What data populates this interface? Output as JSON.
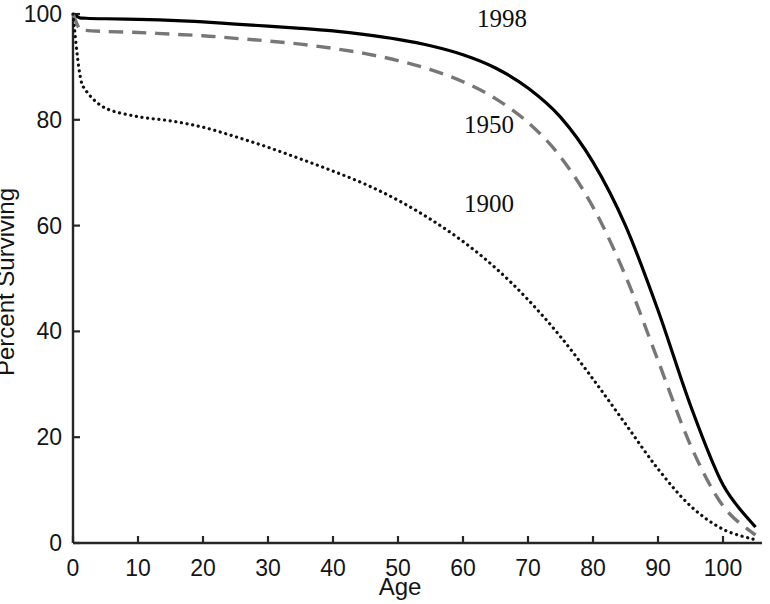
{
  "chart_data": {
    "type": "line",
    "title": "",
    "subtitle": "",
    "xlabel": "Age",
    "ylabel": "Percent Surviving",
    "xlim": [
      0,
      106
    ],
    "ylim": [
      0,
      100
    ],
    "grid": false,
    "legend_position": "inline-curve-labels",
    "x_ticks": [
      0,
      10,
      20,
      30,
      40,
      50,
      60,
      70,
      80,
      90,
      100
    ],
    "y_ticks": [
      0,
      20,
      40,
      60,
      80,
      100
    ],
    "x_tick_labels": [
      "0",
      "10",
      "20",
      "30",
      "40",
      "50",
      "60",
      "70",
      "80",
      "90",
      "100"
    ],
    "y_tick_labels": [
      "0",
      "20",
      "40",
      "60",
      "80",
      "100"
    ],
    "x": [
      0,
      1,
      2,
      5,
      10,
      15,
      20,
      25,
      30,
      35,
      40,
      45,
      50,
      55,
      60,
      65,
      70,
      75,
      80,
      85,
      90,
      95,
      100,
      105
    ],
    "series": [
      {
        "name": "1998",
        "style": "solid",
        "color": "#000000",
        "width": 3.2,
        "label_x": 66,
        "label_y": 99,
        "values": [
          100,
          99.3,
          99.2,
          99.1,
          99.0,
          98.8,
          98.5,
          98.1,
          97.7,
          97.3,
          96.8,
          96.1,
          95.2,
          94.0,
          92.3,
          89.8,
          86.0,
          80.5,
          72.0,
          60.0,
          44.0,
          26.0,
          11.0,
          3.0
        ]
      },
      {
        "name": "1950",
        "style": "dashed",
        "color": "#777777",
        "width": 3.4,
        "label_x": 64,
        "label_y": 79,
        "values": [
          100,
          97.2,
          96.9,
          96.7,
          96.5,
          96.2,
          95.9,
          95.4,
          94.9,
          94.3,
          93.5,
          92.5,
          91.2,
          89.5,
          87.2,
          84.0,
          79.5,
          73.0,
          63.5,
          50.5,
          34.5,
          18.5,
          7.0,
          1.5
        ]
      },
      {
        "name": "1900",
        "style": "dotted",
        "color": "#111111",
        "width": 3.2,
        "label_x": 64,
        "label_y": 64,
        "values": [
          100,
          89.0,
          85.5,
          82.2,
          80.6,
          79.8,
          78.6,
          76.8,
          74.8,
          72.6,
          70.3,
          67.8,
          64.8,
          61.2,
          57.0,
          52.0,
          46.0,
          39.0,
          31.0,
          22.5,
          14.0,
          7.0,
          2.6,
          0.6
        ]
      }
    ]
  },
  "axes": {
    "x_axis_name": "age-axis",
    "y_axis_name": "percent-surviving-axis"
  }
}
